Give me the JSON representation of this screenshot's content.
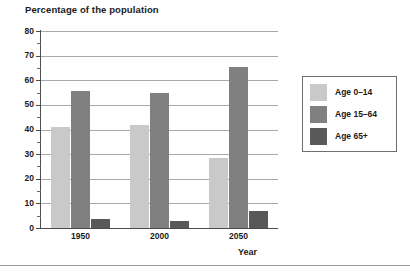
{
  "chart_data": {
    "type": "bar",
    "title": "Percentage of the population",
    "xlabel": "Year",
    "ylabel": "",
    "categories": [
      "1950",
      "2000",
      "2050"
    ],
    "series": [
      {
        "name": "Age 0–14",
        "values": [
          41,
          42,
          28.5
        ],
        "color": "#c9c9c9"
      },
      {
        "name": "Age 15–64",
        "values": [
          55.5,
          55,
          65.5
        ],
        "color": "#808080"
      },
      {
        "name": "Age 65+",
        "values": [
          3.5,
          3,
          7
        ],
        "color": "#595959"
      }
    ],
    "ylim": [
      0,
      80
    ],
    "yticks": [
      0,
      10,
      20,
      30,
      40,
      50,
      60,
      70,
      80
    ],
    "yticklabels": [
      "0",
      "10",
      "20",
      "30",
      "40",
      "50",
      "60",
      "70",
      "80"
    ],
    "yminorticks": [
      5,
      15,
      25,
      35,
      45,
      55,
      65,
      75
    ],
    "grid": true,
    "legend_position": "right"
  },
  "axis": {
    "gridline_color": "#a9a9a9",
    "axis_color": "#4d4d4d"
  }
}
